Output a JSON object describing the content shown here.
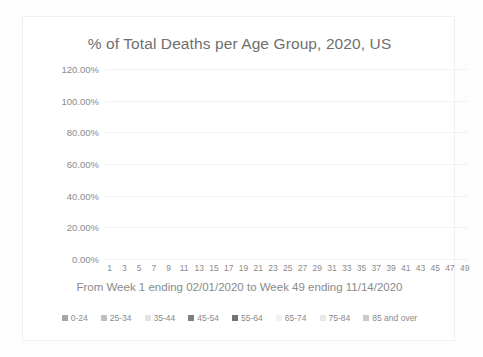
{
  "chart_data": {
    "type": "bar",
    "subtype": "stacked-percentage-column",
    "title": "% of Total Deaths per Age Group, 2020, US",
    "xlabel": "From Week 1 ending 02/01/2020 to Week 49 ending 11/14/2020",
    "ylabel": "",
    "ylim": [
      0,
      120
    ],
    "ytick_labels": [
      "0.00%",
      "20.00%",
      "40.00%",
      "60.00%",
      "80.00%",
      "100.00%",
      "120.00%"
    ],
    "ytick_values": [
      0,
      20,
      40,
      60,
      80,
      100,
      120
    ],
    "grid": true,
    "legend_position": "bottom",
    "categories": [
      1,
      2,
      3,
      4,
      5,
      6,
      7,
      8,
      9,
      10,
      11,
      12,
      13,
      14,
      15,
      16,
      17,
      18,
      19,
      20,
      21,
      22,
      23,
      24,
      25,
      26,
      27,
      28,
      29,
      30,
      31,
      32,
      33,
      34,
      35,
      36,
      37,
      38,
      39,
      40,
      41,
      42,
      43,
      44,
      45,
      46,
      47,
      48,
      49
    ],
    "xtick_labels_shown": [
      1,
      3,
      5,
      7,
      9,
      11,
      13,
      15,
      17,
      19,
      21,
      23,
      25,
      27,
      29,
      31,
      33,
      35,
      37,
      39,
      41,
      43,
      45,
      47,
      49
    ],
    "colors": {
      "0-24": "#a6a6a6",
      "25-34": "#bfbfbf",
      "35-44": "#d9d9d9",
      "45-54": "#808080",
      "55-64": "#737373",
      "65-74": "#f2f2f2",
      "75-84": "#e8e8e8",
      "85 and over": "#c9c9c9"
    },
    "series": [
      {
        "name": "0-24",
        "values": [
          1.1,
          1.1,
          1.1,
          1.1,
          1.1,
          1.1,
          1.1,
          1.1,
          1.1,
          1.1,
          1.1,
          1.1,
          1.1,
          1.1,
          1.2,
          1.2,
          1.2,
          1.2,
          1.3,
          1.3,
          1.4,
          1.4,
          1.4,
          1.4,
          1.4,
          1.4,
          1.4,
          1.4,
          1.4,
          1.4,
          1.3,
          1.3,
          1.3,
          1.3,
          1.3,
          1.3,
          1.2,
          1.2,
          1.2,
          1.2,
          1.2,
          1.2,
          1.1,
          1.1,
          1.1,
          1.1,
          1.1,
          1.0,
          0.9
        ]
      },
      {
        "name": "25-34",
        "values": [
          1.6,
          1.6,
          1.6,
          1.6,
          1.6,
          1.6,
          1.6,
          1.6,
          1.6,
          1.7,
          1.7,
          1.7,
          1.7,
          1.8,
          1.8,
          1.9,
          1.9,
          1.9,
          2.0,
          2.1,
          2.1,
          2.2,
          2.2,
          2.2,
          2.2,
          2.2,
          2.1,
          2.1,
          2.1,
          2.1,
          2.0,
          2.0,
          2.0,
          2.0,
          1.9,
          1.9,
          1.9,
          1.9,
          1.9,
          1.8,
          1.8,
          1.8,
          1.7,
          1.7,
          1.7,
          1.6,
          1.6,
          1.5,
          1.3
        ]
      },
      {
        "name": "35-44",
        "values": [
          2.4,
          2.4,
          2.4,
          2.4,
          2.4,
          2.4,
          2.4,
          2.5,
          2.5,
          2.5,
          2.6,
          2.6,
          2.7,
          2.8,
          2.9,
          3.0,
          3.1,
          3.2,
          3.3,
          3.4,
          3.4,
          3.5,
          3.5,
          3.5,
          3.5,
          3.4,
          3.4,
          3.3,
          3.3,
          3.3,
          3.2,
          3.2,
          3.2,
          3.1,
          3.1,
          3.0,
          3.0,
          3.0,
          2.9,
          2.9,
          2.9,
          2.8,
          2.8,
          2.7,
          2.7,
          2.6,
          2.5,
          2.4,
          2.1
        ]
      },
      {
        "name": "45-54",
        "values": [
          6.0,
          6.0,
          6.0,
          5.9,
          5.9,
          5.9,
          5.9,
          6.0,
          6.0,
          6.1,
          6.2,
          6.3,
          6.5,
          6.7,
          6.9,
          7.1,
          7.2,
          7.3,
          7.4,
          7.5,
          7.5,
          7.6,
          7.7,
          7.7,
          7.6,
          7.5,
          7.4,
          7.4,
          7.3,
          7.3,
          7.2,
          7.2,
          7.1,
          7.1,
          7.0,
          7.0,
          6.9,
          6.9,
          6.8,
          6.8,
          6.7,
          6.6,
          6.5,
          6.4,
          6.3,
          6.2,
          6.0,
          5.8,
          5.2
        ]
      },
      {
        "name": "55-64",
        "values": [
          14.8,
          14.8,
          14.8,
          14.7,
          14.7,
          14.7,
          14.7,
          14.8,
          14.9,
          15.0,
          15.1,
          15.3,
          15.5,
          15.7,
          16.0,
          16.2,
          16.3,
          16.4,
          16.5,
          16.6,
          16.7,
          16.8,
          16.9,
          16.9,
          16.8,
          16.7,
          16.6,
          16.5,
          16.4,
          16.4,
          16.3,
          16.2,
          16.1,
          16.0,
          15.9,
          15.8,
          15.7,
          15.6,
          15.5,
          15.4,
          15.3,
          15.1,
          14.9,
          14.7,
          14.5,
          14.3,
          14.0,
          13.6,
          12.2
        ]
      },
      {
        "name": "65-74",
        "values": [
          20.5,
          20.5,
          20.5,
          20.4,
          20.4,
          20.4,
          20.4,
          20.5,
          20.6,
          20.7,
          20.8,
          21.0,
          21.2,
          21.4,
          21.6,
          21.8,
          21.9,
          22.0,
          22.1,
          22.2,
          22.3,
          22.4,
          22.5,
          22.5,
          22.4,
          22.3,
          22.2,
          22.1,
          22.1,
          22.0,
          21.9,
          21.9,
          21.8,
          21.7,
          21.7,
          21.6,
          21.5,
          21.5,
          21.4,
          21.3,
          21.2,
          21.1,
          21.0,
          20.8,
          20.6,
          20.4,
          20.1,
          19.6,
          17.8
        ]
      },
      {
        "name": "75-84",
        "values": [
          24.6,
          24.6,
          24.6,
          24.6,
          24.6,
          24.6,
          24.6,
          24.6,
          24.6,
          24.6,
          24.5,
          24.5,
          24.4,
          24.3,
          24.2,
          24.1,
          24.0,
          23.9,
          23.8,
          23.7,
          23.6,
          23.5,
          23.4,
          23.4,
          23.5,
          23.6,
          23.7,
          23.8,
          23.9,
          23.9,
          24.0,
          24.0,
          24.1,
          24.2,
          24.2,
          24.3,
          24.4,
          24.4,
          24.5,
          24.5,
          24.6,
          24.7,
          24.8,
          24.9,
          25.0,
          25.0,
          24.9,
          24.5,
          22.3
        ]
      },
      {
        "name": "85 and over",
        "values": [
          29.0,
          29.0,
          29.0,
          29.3,
          29.3,
          29.3,
          29.3,
          28.9,
          28.7,
          28.3,
          28.0,
          27.6,
          26.9,
          26.2,
          25.4,
          24.7,
          24.4,
          24.1,
          23.6,
          23.2,
          23.0,
          22.6,
          22.4,
          22.4,
          22.6,
          22.9,
          23.2,
          23.4,
          23.5,
          23.6,
          24.1,
          24.2,
          24.4,
          24.6,
          24.9,
          25.1,
          25.4,
          25.5,
          25.8,
          26.1,
          26.3,
          26.7,
          27.2,
          27.7,
          28.1,
          28.8,
          29.8,
          31.6,
          37.2
        ]
      }
    ]
  },
  "legend": {
    "items": [
      {
        "label": "0-24",
        "color": "#a6a6a6"
      },
      {
        "label": "25-34",
        "color": "#bfbfbf"
      },
      {
        "label": "35-44",
        "color": "#e3e3e3"
      },
      {
        "label": "45-54",
        "color": "#808080"
      },
      {
        "label": "55-64",
        "color": "#737373"
      },
      {
        "label": "65-74",
        "color": "#f2f2f2"
      },
      {
        "label": "75-84",
        "color": "#e8e8e8"
      },
      {
        "label": "85 and over",
        "color": "#c9c9c9"
      }
    ]
  }
}
